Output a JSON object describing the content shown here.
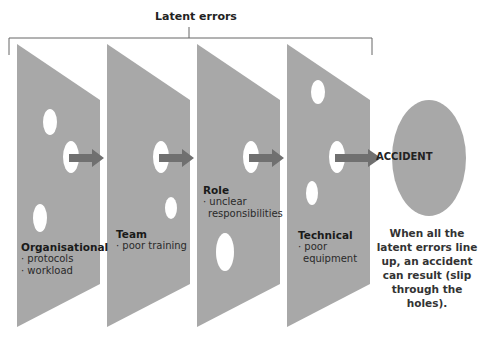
{
  "title": "Latent errors",
  "layers": [
    {
      "name": "Organisational",
      "items": [
        "· protocols",
        "· workload"
      ]
    },
    {
      "name": "Team",
      "items": [
        "· poor training"
      ]
    },
    {
      "name": "Role",
      "items": [
        "· unclear",
        "  responsibilities"
      ]
    },
    {
      "name": "Technical",
      "items": [
        "· poor",
        "  equipment"
      ]
    }
  ],
  "outcome": "ACCIDENT",
  "caption": "When all the latent errors line up, an accident can result (slip through the holes).",
  "colors": {
    "panel": "#a8a8a8",
    "arrow": "#707070",
    "hole": "#ffffff",
    "line": "#555555"
  }
}
